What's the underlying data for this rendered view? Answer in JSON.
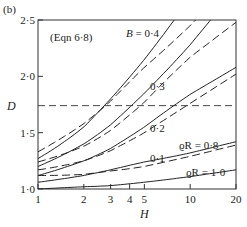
{
  "chart_data": {
    "type": "line",
    "panel_label": "(b)",
    "annotation": "(Eqn 6·8)",
    "xlabel": "H",
    "ylabel": "D",
    "xscale": "log",
    "xlim": [
      1,
      20
    ],
    "ylim": [
      1.0,
      2.5
    ],
    "xticks": [
      1,
      2,
      3,
      4,
      5,
      10,
      20
    ],
    "xtick_labels": [
      "1",
      "2",
      "3",
      "4",
      "5",
      "10",
      "20"
    ],
    "yticks": [
      1.0,
      1.5,
      2.0,
      2.5
    ],
    "ytick_labels": [
      "1·0",
      "1·5",
      "2·0",
      "2·5"
    ],
    "reference_line": {
      "orientation": "horizontal",
      "style": "dashed",
      "y": 1.74
    },
    "legend": {
      "solid": "ϱR = 1·0",
      "dashed": "ϱR = 0·8"
    },
    "curve_labels": [
      "B = 0·4",
      "0·3",
      "0·2",
      "0·1"
    ],
    "x": [
      1,
      2,
      3,
      5,
      10,
      20
    ],
    "series": [
      {
        "name": "B = 0·4, ϱR = 1·0",
        "style": "solid",
        "B": 0.4,
        "rhoR": 1.0,
        "values": [
          1.27,
          1.55,
          1.8,
          2.15,
          2.5,
          2.5
        ]
      },
      {
        "name": "B = 0·4, ϱR = 0·8",
        "style": "dashed",
        "B": 0.4,
        "rhoR": 0.8,
        "values": [
          1.33,
          1.58,
          1.78,
          2.08,
          2.45,
          2.5
        ]
      },
      {
        "name": "B = 0·3, ϱR = 1·0",
        "style": "solid",
        "B": 0.3,
        "rhoR": 1.0,
        "values": [
          1.2,
          1.4,
          1.57,
          1.85,
          2.28,
          2.5
        ]
      },
      {
        "name": "B = 0·3, ϱR = 0·8",
        "style": "dashed",
        "B": 0.3,
        "rhoR": 0.8,
        "values": [
          1.24,
          1.38,
          1.52,
          1.77,
          2.17,
          2.48
        ]
      },
      {
        "name": "B = 0·2, ϱR = 1·0",
        "style": "solid",
        "B": 0.2,
        "rhoR": 1.0,
        "values": [
          1.12,
          1.25,
          1.36,
          1.55,
          1.84,
          2.08
        ]
      },
      {
        "name": "B = 0·2, ϱR = 0·8",
        "style": "dashed",
        "B": 0.2,
        "rhoR": 0.8,
        "values": [
          1.17,
          1.25,
          1.34,
          1.5,
          1.76,
          2.02
        ]
      },
      {
        "name": "B = 0·1, ϱR = 1·0",
        "style": "solid",
        "B": 0.1,
        "rhoR": 1.0,
        "values": [
          1.06,
          1.12,
          1.17,
          1.24,
          1.32,
          1.42
        ]
      },
      {
        "name": "B = 0·1, ϱR = 0·8",
        "style": "dashed",
        "B": 0.1,
        "rhoR": 0.8,
        "values": [
          1.12,
          1.13,
          1.16,
          1.2,
          1.29,
          1.39
        ]
      },
      {
        "name": "B = 0, ϱR = 1·0",
        "style": "solid",
        "B": 0.0,
        "rhoR": 1.0,
        "values": [
          1.0,
          1.02,
          1.03,
          1.06,
          1.11,
          1.17
        ]
      }
    ]
  }
}
